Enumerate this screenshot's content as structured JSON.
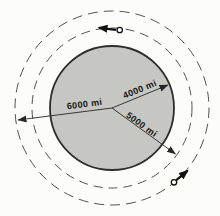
{
  "figure": {
    "type": "planet-orbit-diagram",
    "planet": {
      "radius_mi": 4000,
      "radius_label": "4000 mi"
    },
    "inner_orbit": {
      "radius_mi": 5000,
      "radius_label": "5000 mi",
      "satellite": {
        "position": "top",
        "velocity_direction": "left (counterclockwise)"
      }
    },
    "outer_orbit": {
      "radius_mi": 6000,
      "radius_label": "6000 mi",
      "satellite": {
        "position": "lower-right",
        "velocity_direction": "up-right (counterclockwise)"
      }
    },
    "colors": {
      "background": "#fcfcf9",
      "planet_fill": "#c6c6c3",
      "planet_stroke": "#2f2d28",
      "orbit_dash": "#54524c",
      "arrow": "#111111",
      "label_text": "#17160f"
    }
  }
}
